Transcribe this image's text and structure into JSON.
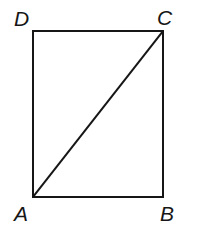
{
  "figure": {
    "name": "rectangle-with-diagonal",
    "background_color": "#ffffff",
    "stroke_color": "#161616",
    "stroke_width": 2,
    "canvas": {
      "width": 201,
      "height": 239
    },
    "vertices": [
      {
        "id": "D",
        "label": "D",
        "x": 33,
        "y": 31,
        "position": "top-left"
      },
      {
        "id": "C",
        "label": "C",
        "x": 163,
        "y": 31,
        "position": "top-right"
      },
      {
        "id": "B",
        "label": "B",
        "x": 163,
        "y": 197,
        "position": "bottom-right"
      },
      {
        "id": "A",
        "label": "A",
        "x": 33,
        "y": 197,
        "position": "bottom-left"
      }
    ],
    "edges": [
      {
        "name": "edge-DC",
        "from": "D",
        "to": "C"
      },
      {
        "name": "edge-CB",
        "from": "C",
        "to": "B"
      },
      {
        "name": "edge-BA",
        "from": "B",
        "to": "A"
      },
      {
        "name": "edge-AD",
        "from": "A",
        "to": "D"
      }
    ],
    "diagonals": [
      {
        "name": "diagonal-AC",
        "from": "A",
        "to": "C"
      }
    ],
    "labels": {
      "D": "D",
      "C": "C",
      "A": "A",
      "B": "B"
    }
  }
}
